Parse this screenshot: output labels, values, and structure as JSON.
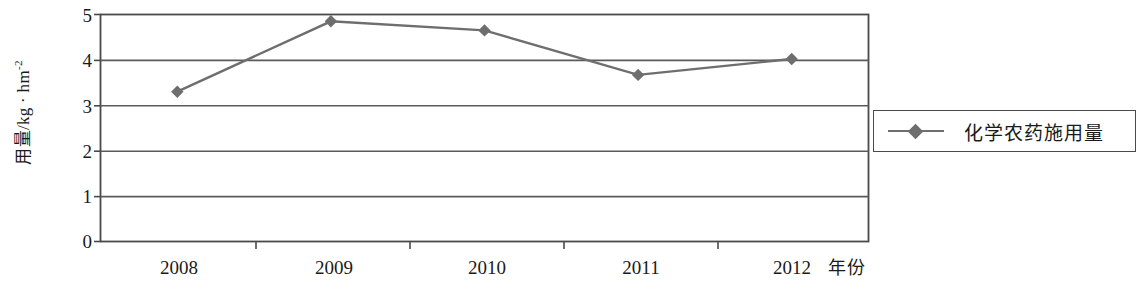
{
  "chart_data": {
    "type": "line",
    "title": "",
    "xlabel": "年份",
    "ylabel": "用量/kg · hm",
    "ylabel_sup": "-2",
    "categories": [
      "2008",
      "2009",
      "2010",
      "2011",
      "2012"
    ],
    "series": [
      {
        "name": "化学农药施用量",
        "values": [
          3.3,
          4.85,
          4.65,
          3.67,
          4.02
        ],
        "color": "#6e6e6e",
        "marker": "diamond"
      }
    ],
    "ylim": [
      0,
      5
    ],
    "yticks": [
      "0",
      "1",
      "2",
      "3",
      "4",
      "5"
    ],
    "ytick_values": [
      0,
      1,
      2,
      3,
      4,
      5
    ],
    "grid": "horizontal",
    "legend_position": "right-outside"
  },
  "legend": {
    "entries": [
      {
        "label": "化学农药施用量",
        "marker_icon": "diamond-marker-icon"
      }
    ]
  },
  "axes": {
    "y_title": "用量/kg · hm",
    "y_title_sup": "-2",
    "x_title": "年份"
  },
  "colors": {
    "series": "#6e6e6e",
    "axis": "#4a4a4a",
    "grid": "#5a5a5a",
    "text": "#1a1a1a",
    "background": "#ffffff"
  }
}
